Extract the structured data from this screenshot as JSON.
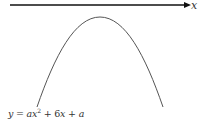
{
  "diagram": {
    "axis": {
      "label": "x",
      "color": "#111111"
    },
    "curve": {
      "shape": "downward parabola",
      "color": "#555555"
    },
    "equation": {
      "lhs": "y",
      "eq": " = ",
      "term1_coef": "a",
      "term1_var": "x",
      "term1_exp": "2",
      "plus1": " + 6",
      "term2_var": "x",
      "plus2": " + ",
      "const": "a"
    }
  }
}
